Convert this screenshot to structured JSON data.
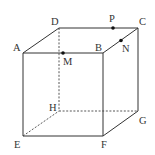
{
  "figure": {
    "type": "cube",
    "vertices": {
      "A": "A",
      "B": "B",
      "C": "C",
      "D": "D",
      "E": "E",
      "F": "F",
      "G": "G",
      "H": "H"
    },
    "points": {
      "M": {
        "label": "M",
        "on_edge": "AB"
      },
      "N": {
        "label": "N",
        "on_edge": "BC"
      },
      "P": {
        "label": "P",
        "on_edge": "DC"
      }
    },
    "visible_edges": [
      "AB",
      "BC",
      "CD",
      "DA",
      "AE",
      "BF",
      "CG",
      "EF",
      "FG"
    ],
    "hidden_edges": [
      "DH",
      "EH",
      "HG"
    ],
    "colors": {
      "line": "#333333",
      "point": "#111111",
      "background": "#ffffff"
    }
  }
}
